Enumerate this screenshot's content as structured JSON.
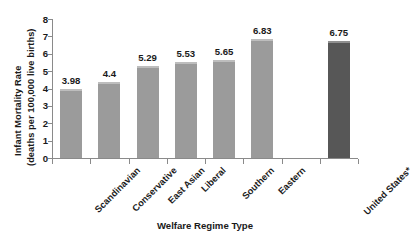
{
  "chart_data": {
    "type": "bar",
    "title": "",
    "xlabel": "Welfare Regime Type",
    "ylabel_line1": "Infant Mortality Rate",
    "ylabel_line2": "(deaths per 100,000 live births)",
    "categories": [
      "Scandinavian",
      "Conservative",
      "East Asian",
      "Liberal",
      "Southern",
      "Eastern",
      "United States*"
    ],
    "values": [
      3.98,
      4.4,
      5.29,
      5.53,
      5.65,
      6.83,
      6.75
    ],
    "value_labels": [
      "3.98",
      "4.4",
      "5.29",
      "5.53",
      "5.65",
      "6.83",
      "6.75"
    ],
    "ylim": [
      0,
      8
    ],
    "yticks": [
      8,
      7,
      6,
      5,
      4,
      3,
      2,
      1,
      0
    ],
    "ytick_labels": [
      "8",
      "7",
      "6",
      "5",
      "4",
      "3",
      "2",
      "1",
      "0"
    ],
    "grid": false,
    "legend": "none",
    "bar_colors": [
      "#9b9b9b",
      "#9b9b9b",
      "#9b9b9b",
      "#9b9b9b",
      "#9b9b9b",
      "#9b9b9b",
      "#575757"
    ],
    "slot_index": [
      0,
      1,
      2,
      3,
      4,
      5,
      7
    ],
    "slot_count": 8,
    "axis_color": "#8a8a8a",
    "text_color": "#1a1a1a",
    "highlight_color": "#575757",
    "default_bar_color": "#9b9b9b"
  }
}
